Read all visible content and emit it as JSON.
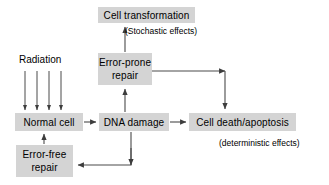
{
  "diagram": {
    "style": {
      "box_fill": "#d4d4d4",
      "box_text": "#000000",
      "line": "#4a4a4a",
      "background": "#ffffff"
    },
    "nodes": [
      {
        "id": "cell-transformation",
        "label": "Cell transformation",
        "x": 98,
        "y": 7,
        "w": 97,
        "h": 16
      },
      {
        "id": "error-prone-repair",
        "label": "Error-prone\nrepair",
        "x": 98,
        "y": 53,
        "w": 54,
        "h": 32
      },
      {
        "id": "normal-cell",
        "label": "Normal cell",
        "x": 15,
        "y": 113,
        "w": 68,
        "h": 18
      },
      {
        "id": "dna-damage",
        "label": "DNA damage",
        "x": 99,
        "y": 113,
        "w": 70,
        "h": 18
      },
      {
        "id": "cell-death-apoptosis",
        "label": "Cell death/apoptosis",
        "x": 189,
        "y": 113,
        "w": 107,
        "h": 18
      },
      {
        "id": "error-free-repair",
        "label": "Error-free\nrepair",
        "x": 16,
        "y": 145,
        "w": 57,
        "h": 32
      }
    ],
    "labels": [
      {
        "id": "radiation",
        "text": "Radiation",
        "x": 19,
        "y": 54
      },
      {
        "id": "stochastic-effects",
        "text": "(Stochastic effects)",
        "x": 125,
        "y": 25
      },
      {
        "id": "deterministic-effects",
        "text": "(deterministic effects)",
        "x": 219,
        "y": 137
      }
    ],
    "radiation_arrows": {
      "count": 4,
      "x_positions": [
        25,
        37,
        49,
        61
      ],
      "y_start": 71,
      "y_end": 111
    },
    "edges": [
      {
        "id": "error-prone-to-cell-transformation",
        "from": "error-prone-repair",
        "to": "cell-transformation",
        "points": "125,52 125,26"
      },
      {
        "id": "dna-damage-to-error-prone",
        "from": "dna-damage",
        "to": "error-prone-repair",
        "points": "125,112 125,88"
      },
      {
        "id": "normal-cell-to-dna-damage",
        "from": "normal-cell",
        "to": "dna-damage",
        "points": "84,122 96,122"
      },
      {
        "id": "dna-damage-to-cell-death",
        "from": "dna-damage",
        "to": "cell-death-apoptosis",
        "points": "170,122 186,122"
      },
      {
        "id": "error-prone-to-cell-death",
        "from": "error-prone-repair",
        "to": "cell-death-apoptosis",
        "points": "152,71 225,71 225,109"
      },
      {
        "id": "dna-damage-to-error-free",
        "from": "dna-damage",
        "to": "error-free-repair",
        "points": "131,132 131,165 77,165"
      },
      {
        "id": "error-free-to-normal-cell",
        "from": "error-free-repair",
        "to": "normal-cell",
        "points": "44,144 44,134"
      }
    ]
  }
}
